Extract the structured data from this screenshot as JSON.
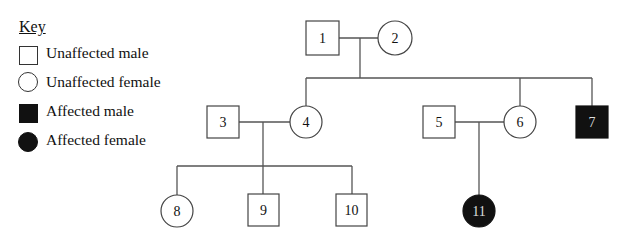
{
  "key": {
    "title": "Key",
    "items": [
      {
        "symbol": "square-open",
        "label": "Unaffected male"
      },
      {
        "symbol": "circle-open",
        "label": "Unaffected female"
      },
      {
        "symbol": "square-filled",
        "label": "Affected male"
      },
      {
        "symbol": "circle-filled",
        "label": "Affected female"
      }
    ]
  },
  "colors": {
    "line": "#555555",
    "affected_fill": "#111111",
    "unaffected_fill": "#ffffff",
    "affected_text": "#dddddd"
  },
  "pedigree": {
    "individuals": [
      {
        "id": "1",
        "sex": "male",
        "affected": false,
        "generation": 1
      },
      {
        "id": "2",
        "sex": "female",
        "affected": false,
        "generation": 1
      },
      {
        "id": "3",
        "sex": "male",
        "affected": false,
        "generation": 2
      },
      {
        "id": "4",
        "sex": "female",
        "affected": false,
        "generation": 2
      },
      {
        "id": "5",
        "sex": "male",
        "affected": false,
        "generation": 2
      },
      {
        "id": "6",
        "sex": "female",
        "affected": false,
        "generation": 2
      },
      {
        "id": "7",
        "sex": "male",
        "affected": true,
        "generation": 2
      },
      {
        "id": "8",
        "sex": "female",
        "affected": false,
        "generation": 3
      },
      {
        "id": "9",
        "sex": "male",
        "affected": false,
        "generation": 3
      },
      {
        "id": "10",
        "sex": "male",
        "affected": false,
        "generation": 3
      },
      {
        "id": "11",
        "sex": "female",
        "affected": true,
        "generation": 3
      }
    ],
    "matings": [
      {
        "partners": [
          "1",
          "2"
        ],
        "children": [
          "4",
          "6",
          "7"
        ]
      },
      {
        "partners": [
          "3",
          "4"
        ],
        "children": [
          "8",
          "9",
          "10"
        ]
      },
      {
        "partners": [
          "5",
          "6"
        ],
        "children": [
          "11"
        ]
      }
    ]
  }
}
